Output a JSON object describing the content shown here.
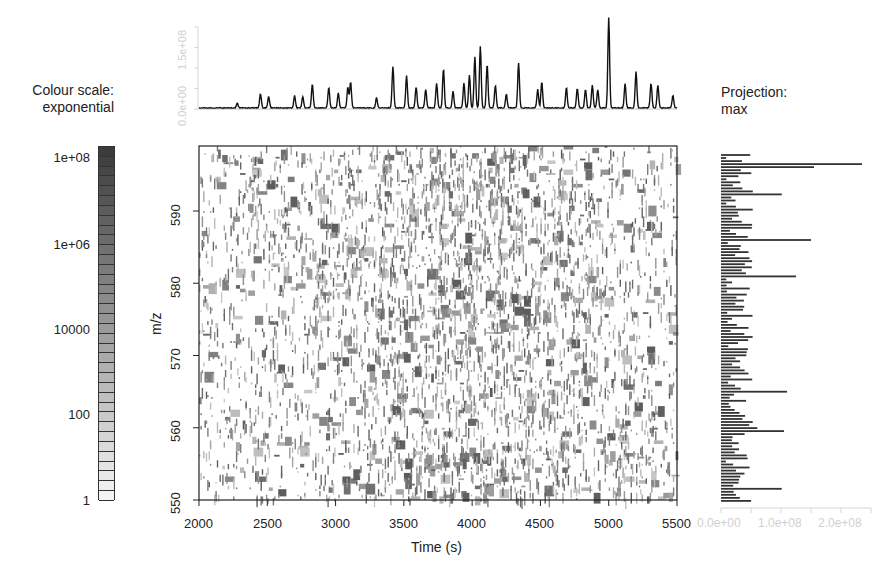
{
  "colour_scale": {
    "title_line1": "Colour scale:",
    "title_line2": "exponential",
    "labels": [
      "1e+08",
      "1e+06",
      "10000",
      "100",
      "1"
    ],
    "cell_count": 36,
    "dark_color": "#3c3c3c",
    "light_color": "#f4f4f4"
  },
  "projection": {
    "title_line1": "Projection:",
    "title_line2": "max",
    "tick_labels": [
      "0.0e+00",
      "1.0e+08",
      "2.0e+08"
    ]
  },
  "chromatogram": {
    "y_tick_labels": [
      "0.0e+00",
      "1.5e+08"
    ]
  },
  "heatmap": {
    "xlabel": "Time (s)",
    "ylabel": "m/z",
    "x_tick_labels": [
      "2000",
      "2500",
      "3000",
      "3500",
      "4000",
      "4500",
      "5000",
      "5500"
    ],
    "y_tick_labels": [
      "550",
      "560",
      "570",
      "580",
      "590"
    ]
  },
  "chart_data": [
    {
      "type": "heatmap",
      "title": "",
      "xlabel": "Time (s)",
      "ylabel": "m/z",
      "xlim": [
        2000,
        5500
      ],
      "ylim": [
        550,
        599
      ],
      "x_ticks": [
        2000,
        2500,
        3000,
        3500,
        4000,
        4500,
        5000,
        5500
      ],
      "y_ticks": [
        550,
        560,
        570,
        580,
        590
      ],
      "colour_scale": "exponential",
      "colour_scale_ticks": [
        1,
        100,
        10000,
        1000000,
        100000000
      ],
      "colormap": "greyscale (white = low, dark grey = high)",
      "grid": false,
      "legend_position": "left"
    },
    {
      "type": "line",
      "title": "Total ion chromatogram (top marginal)",
      "xlabel": "Time (s)",
      "ylabel": "Intensity",
      "xlim": [
        2000,
        5500
      ],
      "ylim": [
        0,
        200000000
      ],
      "y_ticks": [
        0,
        50000000,
        100000000,
        150000000,
        200000000
      ],
      "peaks": [
        {
          "x": 2280,
          "y": 12000000
        },
        {
          "x": 2450,
          "y": 35000000
        },
        {
          "x": 2510,
          "y": 28000000
        },
        {
          "x": 2700,
          "y": 30000000
        },
        {
          "x": 2760,
          "y": 28000000
        },
        {
          "x": 2830,
          "y": 58000000
        },
        {
          "x": 2950,
          "y": 50000000
        },
        {
          "x": 3020,
          "y": 37000000
        },
        {
          "x": 3090,
          "y": 50000000
        },
        {
          "x": 3110,
          "y": 63000000
        },
        {
          "x": 3300,
          "y": 25000000
        },
        {
          "x": 3420,
          "y": 100000000
        },
        {
          "x": 3520,
          "y": 78000000
        },
        {
          "x": 3590,
          "y": 50000000
        },
        {
          "x": 3660,
          "y": 45000000
        },
        {
          "x": 3740,
          "y": 60000000
        },
        {
          "x": 3790,
          "y": 95000000
        },
        {
          "x": 3860,
          "y": 40000000
        },
        {
          "x": 3940,
          "y": 60000000
        },
        {
          "x": 3980,
          "y": 80000000
        },
        {
          "x": 4020,
          "y": 125000000
        },
        {
          "x": 4060,
          "y": 150000000
        },
        {
          "x": 4110,
          "y": 105000000
        },
        {
          "x": 4170,
          "y": 55000000
        },
        {
          "x": 4250,
          "y": 33000000
        },
        {
          "x": 4340,
          "y": 110000000
        },
        {
          "x": 4480,
          "y": 45000000
        },
        {
          "x": 4510,
          "y": 64000000
        },
        {
          "x": 4690,
          "y": 50000000
        },
        {
          "x": 4770,
          "y": 48000000
        },
        {
          "x": 4830,
          "y": 45000000
        },
        {
          "x": 4880,
          "y": 56000000
        },
        {
          "x": 4920,
          "y": 45000000
        },
        {
          "x": 5000,
          "y": 220000000
        },
        {
          "x": 5120,
          "y": 60000000
        },
        {
          "x": 5200,
          "y": 88000000
        },
        {
          "x": 5310,
          "y": 60000000
        },
        {
          "x": 5360,
          "y": 55000000
        },
        {
          "x": 5470,
          "y": 30000000
        }
      ]
    },
    {
      "type": "bar",
      "title": "Projection: max (right marginal, horizontal bars per m/z)",
      "xlabel": "Max intensity",
      "ylabel": "m/z",
      "xlim": [
        0,
        250000000
      ],
      "x_ticks": [
        0,
        50000000,
        100000000,
        150000000,
        200000000,
        250000000
      ],
      "orientation": "horizontal",
      "notable_bars": [
        {
          "mz": 596.5,
          "value": 235000000
        },
        {
          "mz": 596.2,
          "value": 155000000
        },
        {
          "mz": 586.3,
          "value": 150000000
        },
        {
          "mz": 581.0,
          "value": 125000000
        },
        {
          "mz": 565.3,
          "value": 110000000
        },
        {
          "mz": 559.6,
          "value": 105000000
        }
      ]
    }
  ]
}
